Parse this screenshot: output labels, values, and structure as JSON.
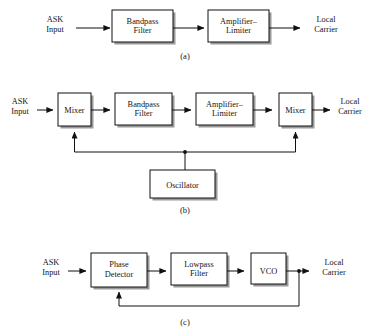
{
  "figure": {
    "background_color": "#ffffff",
    "line_color": "#111111",
    "text_color": "#141414",
    "box_fill": "#ffffff",
    "shadow_color": "#9a9a9a"
  },
  "diagrams": [
    {
      "id": "a",
      "caption": "(a)",
      "input_label_line1": "ASK",
      "input_label_line2": "Input",
      "output_label_line1": "Local",
      "output_label_line2": "Carrier",
      "blocks": [
        {
          "name": "bandpass-filter",
          "line1": "Bandpass",
          "line2": "Filter"
        },
        {
          "name": "amplifier-limiter",
          "line1": "Amplifier–",
          "line2": "Limiter"
        }
      ]
    },
    {
      "id": "b",
      "caption": "(b)",
      "input_label_line1": "ASK",
      "input_label_line2": "Input",
      "output_label_line1": "Local",
      "output_label_line2": "Carrier",
      "blocks": [
        {
          "name": "mixer-input",
          "line1": "Mixer",
          "line2": ""
        },
        {
          "name": "bandpass-filter",
          "line1": "Bandpass",
          "line2": "Filter"
        },
        {
          "name": "amplifier-limiter",
          "line1": "Amplifier–",
          "line2": "Limiter"
        },
        {
          "name": "mixer-output",
          "line1": "Mixer",
          "line2": ""
        },
        {
          "name": "oscillator",
          "line1": "Oscillator",
          "line2": ""
        }
      ]
    },
    {
      "id": "c",
      "caption": "(c)",
      "input_label_line1": "ASK",
      "input_label_line2": "Input",
      "output_label_line1": "Local",
      "output_label_line2": "Carrier",
      "blocks": [
        {
          "name": "phase-detector",
          "line1": "Phase",
          "line2": "Detector"
        },
        {
          "name": "lowpass-filter",
          "line1": "Lowpass",
          "line2": "Filter"
        },
        {
          "name": "vco",
          "line1": "VCO",
          "line2": ""
        }
      ]
    }
  ]
}
